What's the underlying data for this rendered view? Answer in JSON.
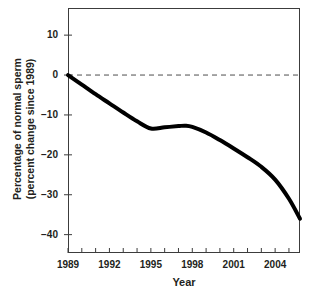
{
  "chart_data": {
    "type": "line",
    "title": "",
    "xlabel": "Year",
    "ylabel": "Percentage of normal sperm\n(percent change since 1989)",
    "xlim": [
      1989,
      2005.8
    ],
    "ylim": [
      -44.6,
      16.8
    ],
    "yticks": [
      10,
      0,
      -10,
      -20,
      -30,
      -40
    ],
    "ytick_labels": [
      "10",
      "0",
      "−10",
      "−20",
      "−30",
      "−40"
    ],
    "xticks": [
      1989,
      1990,
      1991,
      1992,
      1993,
      1994,
      1995,
      1996,
      1997,
      1998,
      1999,
      2000,
      2001,
      2002,
      2003,
      2004,
      2005
    ],
    "xtick_labels_shown": [
      "1989",
      "1992",
      "1995",
      "1998",
      "2001",
      "2004"
    ],
    "xtick_label_years": [
      1989,
      1992,
      1995,
      1998,
      2001,
      2004
    ],
    "grid": false,
    "legend": "none",
    "reference_line": {
      "y": 0,
      "style": "dashed",
      "color": "#4d4d4d"
    },
    "series": [
      {
        "name": "Percent change in normal sperm since 1989",
        "color": "#000000",
        "line_width": 4,
        "x": [
          1989,
          1990,
          1991,
          1992,
          1993,
          1994,
          1995,
          1996,
          1997,
          1997.5,
          1998,
          1999,
          2000,
          2001,
          2002,
          2003,
          2004,
          2005,
          2005.8
        ],
        "values": [
          0,
          -2.4,
          -4.8,
          -7.1,
          -9.4,
          -11.6,
          -13.4,
          -13.1,
          -12.8,
          -12.7,
          -13.0,
          -14.4,
          -16.3,
          -18.4,
          -20.6,
          -23.0,
          -26.2,
          -31.0,
          -36.0
        ]
      }
    ],
    "annotations": []
  },
  "axis": {
    "x_title": "Year",
    "y_title_line1": "Percentage of normal sperm",
    "y_title_line2": "(percent change since 1989)"
  },
  "colors": {
    "line": "#000000",
    "frame": "#3c3c3c",
    "reference": "#4d4d4d",
    "text": "#231f20",
    "background": "#ffffff"
  }
}
